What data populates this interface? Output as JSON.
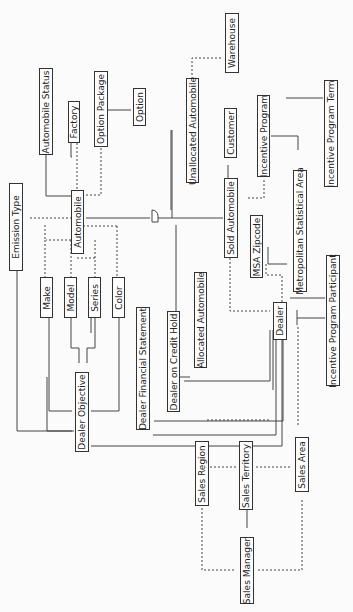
{
  "diagram": {
    "type": "entity-relationship",
    "orientation": "rotated-90",
    "entities": [
      {
        "id": "automobile_status",
        "label": "Automobile Status"
      },
      {
        "id": "factory",
        "label": "Factory"
      },
      {
        "id": "option_package",
        "label": "Option Package"
      },
      {
        "id": "option",
        "label": "Option"
      },
      {
        "id": "warehouse",
        "label": "Warehouse"
      },
      {
        "id": "unallocated_automobile",
        "label": "Unallocated Automobile"
      },
      {
        "id": "customer",
        "label": "Customer"
      },
      {
        "id": "incentive_program",
        "label": "Incentive Program"
      },
      {
        "id": "incentive_program_term",
        "label": "Incentive Program Term"
      },
      {
        "id": "emission_type",
        "label": "Emission Type"
      },
      {
        "id": "automobile",
        "label": "Automobile"
      },
      {
        "id": "sold_automobile",
        "label": "Sold Automobile"
      },
      {
        "id": "msa_zipcode",
        "label": "MSA Zipcode"
      },
      {
        "id": "metropolitan_statistical_area",
        "label": "Metropolitan Statistical Area"
      },
      {
        "id": "make",
        "label": "Make"
      },
      {
        "id": "model",
        "label": "Model"
      },
      {
        "id": "series",
        "label": "Series"
      },
      {
        "id": "color",
        "label": "Color"
      },
      {
        "id": "dealer_financial_statement",
        "label": "Dealer Financial Statement"
      },
      {
        "id": "dealer_on_credit_hold",
        "label": "Dealer on Credit Hold"
      },
      {
        "id": "allocated_automobile",
        "label": "Allocated Automobile"
      },
      {
        "id": "dealer",
        "label": "Dealer"
      },
      {
        "id": "incentive_program_participant",
        "label": "Incentive Program Participant"
      },
      {
        "id": "dealer_objective",
        "label": "Dealer Objective"
      },
      {
        "id": "sales_region",
        "label": "Sales Region"
      },
      {
        "id": "sales_territory",
        "label": "Sales Territory"
      },
      {
        "id": "sales_area",
        "label": "Sales Area"
      },
      {
        "id": "sales_manager",
        "label": "Sales Manager"
      }
    ],
    "relationships": [
      {
        "from": "automobile_status",
        "to": "automobile",
        "style": "solid"
      },
      {
        "from": "factory",
        "to": "automobile",
        "style": "dashed"
      },
      {
        "from": "option_package",
        "to": "automobile",
        "style": "dashed"
      },
      {
        "from": "option_package",
        "to": "option",
        "style": "solid"
      },
      {
        "from": "warehouse",
        "to": "unallocated_automobile",
        "style": "dashed"
      },
      {
        "from": "customer",
        "to": "sold_automobile",
        "style": "solid"
      },
      {
        "from": "incentive_program",
        "to": "incentive_program_term",
        "style": "solid"
      },
      {
        "from": "metropolitan_statistical_area",
        "to": "incentive_program",
        "style": "solid"
      },
      {
        "from": "incentive_program",
        "to": "sold_automobile",
        "style": "dashed"
      },
      {
        "from": "emission_type",
        "to": "automobile",
        "style": "dashed"
      },
      {
        "from": "automobile",
        "to": "unallocated_automobile",
        "style": "subtype"
      },
      {
        "from": "automobile",
        "to": "sold_automobile",
        "style": "subtype"
      },
      {
        "from": "automobile",
        "to": "allocated_automobile",
        "style": "subtype"
      },
      {
        "from": "metropolitan_statistical_area",
        "to": "msa_zipcode",
        "style": "solid"
      },
      {
        "from": "msa_zipcode",
        "to": "dealer",
        "style": "dashed"
      },
      {
        "from": "sold_automobile",
        "to": "dealer",
        "style": "dashed"
      },
      {
        "from": "allocated_automobile",
        "to": "dealer",
        "style": "dashed"
      },
      {
        "from": "metropolitan_statistical_area",
        "to": "incentive_program_participant",
        "style": "solid"
      },
      {
        "from": "dealer",
        "to": "incentive_program_participant",
        "style": "solid"
      },
      {
        "from": "make",
        "to": "automobile",
        "style": "dashed"
      },
      {
        "from": "model",
        "to": "automobile",
        "style": "dashed"
      },
      {
        "from": "series",
        "to": "automobile",
        "style": "dashed"
      },
      {
        "from": "color",
        "to": "automobile",
        "style": "dashed"
      },
      {
        "from": "make",
        "to": "dealer_objective",
        "style": "solid"
      },
      {
        "from": "model",
        "to": "dealer_objective",
        "style": "solid"
      },
      {
        "from": "series",
        "to": "dealer_objective",
        "style": "solid"
      },
      {
        "from": "color",
        "to": "dealer_objective",
        "style": "solid"
      },
      {
        "from": "emission_type",
        "to": "dealer_objective",
        "style": "solid"
      },
      {
        "from": "dealer",
        "to": "dealer_objective",
        "style": "solid"
      },
      {
        "from": "dealer",
        "to": "dealer_financial_statement",
        "style": "solid"
      },
      {
        "from": "dealer",
        "to": "dealer_on_credit_hold",
        "style": "solid"
      },
      {
        "from": "dealer",
        "to": "sales_area",
        "style": "dashed"
      },
      {
        "from": "sales_region",
        "to": "sales_territory",
        "style": "dashed"
      },
      {
        "from": "sales_territory",
        "to": "sales_area",
        "style": "dashed"
      },
      {
        "from": "sales_manager",
        "to": "sales_territory",
        "style": "solid"
      },
      {
        "from": "sales_manager",
        "to": "sales_region",
        "style": "dashed"
      },
      {
        "from": "sales_manager",
        "to": "sales_area",
        "style": "dashed"
      }
    ]
  }
}
